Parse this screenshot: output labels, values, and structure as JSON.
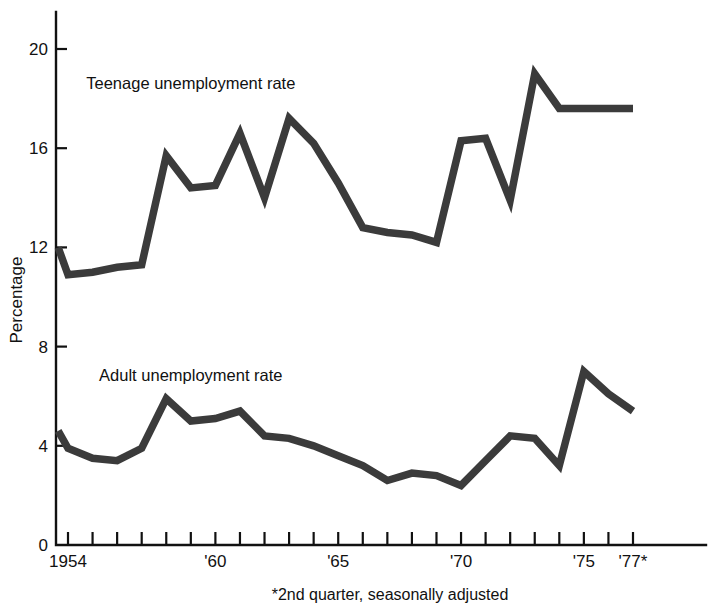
{
  "chart_data": {
    "type": "line",
    "title": "",
    "xlabel": "",
    "ylabel": "Percentage",
    "footnote": "*2nd quarter, seasonally adjusted",
    "grid": false,
    "legend_position": "inline-annotation",
    "xlim": [
      1953.5,
      1977.5
    ],
    "ylim": [
      0,
      21.5
    ],
    "y_ticks": [
      0,
      4,
      8,
      12,
      16,
      20
    ],
    "y_tick_labels": [
      "0",
      "4",
      "8",
      "12",
      "16",
      "20"
    ],
    "x_ticks": [
      1954,
      1955,
      1956,
      1957,
      1958,
      1959,
      1960,
      1961,
      1962,
      1963,
      1964,
      1965,
      1966,
      1967,
      1968,
      1969,
      1970,
      1971,
      1972,
      1973,
      1974,
      1975,
      1976,
      1977
    ],
    "x_tick_labels": [
      "1954",
      "",
      "",
      "",
      "",
      "",
      "'60",
      "",
      "",
      "",
      "",
      "'65",
      "",
      "",
      "",
      "",
      "'70",
      "",
      "",
      "",
      "",
      "'75",
      "",
      "'77*"
    ],
    "x_labeled_ticks": [
      {
        "x": 1954,
        "label": "1954"
      },
      {
        "x": 1960,
        "label": "'60"
      },
      {
        "x": 1965,
        "label": "'65"
      },
      {
        "x": 1970,
        "label": "'70"
      },
      {
        "x": 1975,
        "label": "'75"
      },
      {
        "x": 1977,
        "label": "'77*"
      }
    ],
    "x": [
      1953.6,
      1954,
      1955,
      1956,
      1957,
      1958,
      1959,
      1960,
      1961,
      1962,
      1963,
      1964,
      1965,
      1966,
      1967,
      1968,
      1969,
      1970,
      1971,
      1972,
      1973,
      1974,
      1975,
      1976,
      1977
    ],
    "series": [
      {
        "name": "Teenage unemployment rate",
        "label": "Teenage unemployment rate",
        "label_x": 1959.0,
        "label_y": 18.4,
        "color": "#3b3b3b",
        "values": [
          12.0,
          10.9,
          11.0,
          11.2,
          11.3,
          15.7,
          14.4,
          14.5,
          16.6,
          14.0,
          17.2,
          16.2,
          14.6,
          12.8,
          12.6,
          12.5,
          12.2,
          16.3,
          16.4,
          13.9,
          19.0,
          17.6,
          17.6,
          17.6,
          17.6
        ]
      },
      {
        "name": "Adult unemployment rate",
        "label": "Adult unemployment rate",
        "label_x": 1959.0,
        "label_y": 6.6,
        "color": "#3b3b3b",
        "values": [
          4.6,
          3.9,
          3.5,
          3.4,
          3.9,
          5.9,
          5.0,
          5.1,
          5.4,
          4.4,
          4.3,
          4.0,
          3.6,
          3.2,
          2.6,
          2.9,
          2.8,
          2.4,
          3.4,
          4.4,
          4.3,
          3.2,
          7.0,
          6.1,
          5.4
        ]
      }
    ]
  },
  "axis": {
    "y_axis_title": "Percentage"
  }
}
